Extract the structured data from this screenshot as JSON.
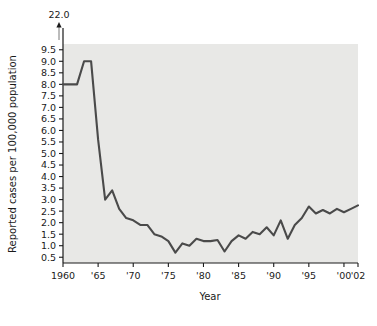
{
  "chart_data": {
    "type": "line",
    "title": "",
    "xlabel": "Year",
    "ylabel": "Reported cases per 100,000 population",
    "grid": false,
    "legend": "none",
    "xlim": [
      1960,
      2002
    ],
    "ylim": [
      0.25,
      9.75
    ],
    "y_axis_break": true,
    "y_break_label": "22.0",
    "y_tick_labels": [
      "0.5",
      "1.0",
      "1.5",
      "2.0",
      "2.5",
      "3.0",
      "3.5",
      "4.0",
      "4.5",
      "5.0",
      "5.5",
      "6.0",
      "6.5",
      "7.0",
      "7.5",
      "8.0",
      "8.5",
      "9.0",
      "9.5"
    ],
    "y_tick_values": [
      0.5,
      1.0,
      1.5,
      2.0,
      2.5,
      3.0,
      3.5,
      4.0,
      4.5,
      5.0,
      5.5,
      6.0,
      6.5,
      7.0,
      7.5,
      8.0,
      8.5,
      9.0,
      9.5
    ],
    "x_tick_labels": [
      "1960",
      "'65",
      "'70",
      "'75",
      "'80",
      "'85",
      "'90",
      "'95",
      "'00",
      "'02"
    ],
    "x_tick_values": [
      1960,
      1965,
      1970,
      1975,
      1980,
      1985,
      1990,
      1995,
      2000,
      2002
    ],
    "x": [
      1960,
      1961,
      1962,
      1963,
      1964,
      1965,
      1966,
      1967,
      1968,
      1969,
      1970,
      1971,
      1972,
      1973,
      1974,
      1975,
      1976,
      1977,
      1978,
      1979,
      1980,
      1981,
      1982,
      1983,
      1984,
      1985,
      1986,
      1987,
      1988,
      1989,
      1990,
      1991,
      1992,
      1993,
      1994,
      1995,
      1996,
      1997,
      1998,
      1999,
      2000,
      2001,
      2002
    ],
    "values": [
      8.0,
      8.0,
      8.0,
      9.0,
      9.0,
      5.6,
      3.0,
      3.4,
      2.6,
      2.2,
      2.1,
      1.9,
      1.9,
      1.5,
      1.4,
      1.2,
      0.7,
      1.1,
      1.0,
      1.3,
      1.2,
      1.2,
      1.25,
      0.75,
      1.2,
      1.45,
      1.3,
      1.6,
      1.5,
      1.8,
      1.45,
      2.1,
      1.3,
      1.9,
      2.2,
      2.7,
      2.4,
      2.55,
      2.4,
      2.6,
      2.45,
      2.6,
      2.75
    ],
    "line_color": "#4a4a4a",
    "plot_bg_color": "#e8e8e6"
  },
  "axis": {
    "break_marker_name": "axis-break-arrow"
  }
}
